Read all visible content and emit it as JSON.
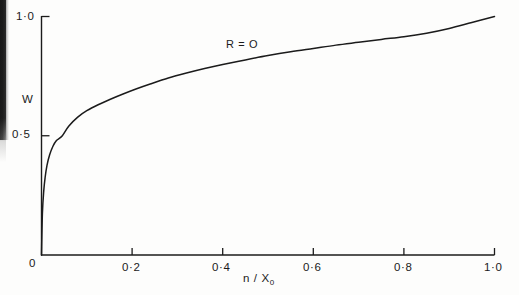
{
  "figure": {
    "background_color": "#fdfdfc",
    "ink_color": "#1b1b1b",
    "width": 519,
    "height": 295
  },
  "axes": {
    "x_axis_label": "n / X",
    "x_axis_label_subscript": "0",
    "y_axis_label": "W",
    "x_tick_labels": [
      "0",
      "0·2",
      "0·4",
      "0·6",
      "0·8",
      "1·0"
    ],
    "y_tick_labels": [
      "0",
      "0·5",
      "1·0"
    ]
  },
  "annotations": [
    {
      "name": "curve-label",
      "text": "R = O"
    }
  ],
  "chart_data": {
    "type": "line",
    "title": "",
    "subtitle": "",
    "xlabel": "n / X₀",
    "ylabel": "W",
    "xlim": [
      0,
      1.0
    ],
    "ylim": [
      0,
      1.0
    ],
    "grid": false,
    "legend_position": "none",
    "x_ticks": [
      0,
      0.2,
      0.4,
      0.6,
      0.8,
      1.0
    ],
    "x_tick_labels": [
      "0",
      "0·2",
      "0·4",
      "0·6",
      "0·8",
      "1·0"
    ],
    "y_ticks": [
      0,
      0.5,
      1.0
    ],
    "y_tick_labels": [
      "0",
      "0·5",
      "1·0"
    ],
    "series": [
      {
        "name": "R = O",
        "label": "R = O",
        "color": "#1b1b1b",
        "x": [
          0.0,
          0.002,
          0.005,
          0.008,
          0.012,
          0.018,
          0.025,
          0.033,
          0.046,
          0.06,
          0.08,
          0.1,
          0.125,
          0.152,
          0.18,
          0.21,
          0.24,
          0.28,
          0.32,
          0.36,
          0.4,
          0.45,
          0.5,
          0.55,
          0.6,
          0.65,
          0.7,
          0.75,
          0.8,
          0.85,
          0.9,
          0.95,
          1.0
        ],
        "y": [
          0.0,
          0.175,
          0.27,
          0.325,
          0.375,
          0.42,
          0.455,
          0.48,
          0.5,
          0.54,
          0.578,
          0.605,
          0.63,
          0.653,
          0.675,
          0.697,
          0.717,
          0.742,
          0.763,
          0.782,
          0.799,
          0.818,
          0.836,
          0.852,
          0.866,
          0.88,
          0.892,
          0.904,
          0.915,
          0.93,
          0.95,
          0.975,
          1.0
        ]
      }
    ],
    "annotations": [
      {
        "text": "R = O",
        "x": 0.39,
        "y": 0.845
      }
    ]
  }
}
